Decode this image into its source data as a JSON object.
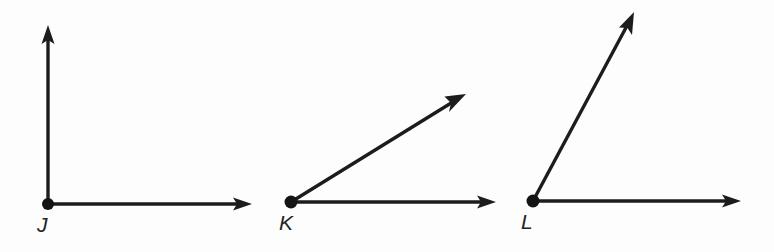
{
  "figure": {
    "width": 774,
    "height": 252,
    "background_color": "#fdfdfd",
    "stroke_color": "#1c1c1c",
    "label_color": "#232323"
  },
  "angles": [
    {
      "id": "angle-j",
      "vertex_label": "J",
      "vertex": {
        "x": 48,
        "y": 204
      },
      "label_pos": {
        "x": 37,
        "y": 214
      },
      "measure_degrees": 90,
      "classification": "right",
      "rays": [
        {
          "name": "vertical-ray",
          "from": {
            "x": 48,
            "y": 204
          },
          "to": {
            "x": 48,
            "y": 26
          },
          "direction_degrees": 90
        },
        {
          "name": "horizontal-ray",
          "from": {
            "x": 48,
            "y": 204
          },
          "to": {
            "x": 251,
            "y": 204
          },
          "direction_degrees": 0
        }
      ]
    },
    {
      "id": "angle-k",
      "vertex_label": "K",
      "vertex": {
        "x": 291,
        "y": 202
      },
      "label_pos": {
        "x": 279,
        "y": 212
      },
      "measure_degrees": 32,
      "classification": "acute",
      "rays": [
        {
          "name": "diagonal-ray",
          "from": {
            "x": 291,
            "y": 202
          },
          "to": {
            "x": 466,
            "y": 94
          },
          "direction_degrees": 32
        },
        {
          "name": "horizontal-ray",
          "from": {
            "x": 291,
            "y": 202
          },
          "to": {
            "x": 495,
            "y": 202
          },
          "direction_degrees": 0
        }
      ]
    },
    {
      "id": "angle-l",
      "vertex_label": "L",
      "vertex": {
        "x": 533,
        "y": 201
      },
      "label_pos": {
        "x": 521,
        "y": 211
      },
      "measure_degrees": 62,
      "classification": "acute",
      "rays": [
        {
          "name": "diagonal-ray",
          "from": {
            "x": 533,
            "y": 201
          },
          "to": {
            "x": 634,
            "y": 12
          },
          "direction_degrees": 62
        },
        {
          "name": "horizontal-ray",
          "from": {
            "x": 533,
            "y": 201
          },
          "to": {
            "x": 740,
            "y": 201
          },
          "direction_degrees": 0
        }
      ]
    }
  ]
}
